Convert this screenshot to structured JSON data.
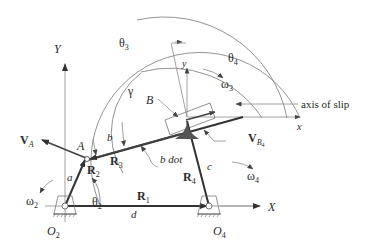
{
  "diagram": {
    "ground_axes": {
      "x_label": "X",
      "y_label": "Y"
    },
    "local_axes": {
      "x_label": "x",
      "y_label": "y"
    },
    "pivots": {
      "o2": "O",
      "o2_sub": "2",
      "o4": "O",
      "o4_sub": "4"
    },
    "points": {
      "a": "A",
      "b": "B"
    },
    "links": {
      "a": "a",
      "b": "b",
      "c": "c",
      "d": "d"
    },
    "vectors": {
      "r1": "R",
      "r1_sub": "1",
      "r2": "R",
      "r2_sub": "2",
      "r3": "R",
      "r3_sub": "3",
      "r4": "R",
      "r4_sub": "4"
    },
    "velocities": {
      "va": "V",
      "va_sub": "A",
      "vb4": "V",
      "vb4_sub": "B",
      "vb4_subsub": "4"
    },
    "angles": {
      "theta2": "θ",
      "theta2_sub": "2",
      "theta3": "θ",
      "theta3_sub": "3",
      "theta4": "θ",
      "theta4_sub": "4",
      "gamma": "γ"
    },
    "angular_velocities": {
      "omega2": "ω",
      "omega2_sub": "2",
      "omega3": "ω",
      "omega3_sub": "3",
      "omega4": "ω",
      "omega4_sub": "4"
    },
    "annotations": {
      "axis_of_slip": "axis of slip",
      "b_dot": "b dot"
    },
    "colors": {
      "line": "#333333",
      "thin": "#8a8a8a",
      "background": "#ffffff",
      "hatch": "#555555"
    }
  }
}
